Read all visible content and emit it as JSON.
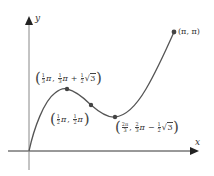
{
  "diagram": {
    "type": "function-graph",
    "axes": {
      "x_label": "x",
      "y_label": "y",
      "origin_px": [
        29,
        151
      ]
    },
    "curve": {
      "description": "y = x + sin(2x), 0 <= x <= pi",
      "color": "#555555"
    },
    "points": [
      {
        "name": "local-max",
        "label": "(1/3 π, 1/3 π + 1/2 √3)",
        "px": [
          67,
          89
        ]
      },
      {
        "name": "inflection",
        "label": "(1/2 π, 1/2 π)",
        "px": [
          91,
          105
        ]
      },
      {
        "name": "local-min",
        "label": "(2π/3, 2/3 π − 1/2 √3)",
        "px": [
          115,
          117
        ]
      },
      {
        "name": "endpoint",
        "label": "(π, π)",
        "px": [
          174,
          32
        ]
      }
    ],
    "labels": {
      "max": {
        "a_num": "1",
        "a_den": "3",
        "pi": "π",
        "b_num": "1",
        "b_den": "3",
        "plus": "+",
        "c_num": "1",
        "c_den": "2",
        "root": "3"
      },
      "inflection": {
        "a_num": "1",
        "a_den": "2",
        "pi": "π",
        "b_num": "1",
        "b_den": "2"
      },
      "min": {
        "a_num": "2π",
        "a_den": "3",
        "b_num": "2",
        "b_den": "3",
        "pi": "π",
        "minus": "−",
        "c_num": "1",
        "c_den": "2",
        "root": "3"
      },
      "end": {
        "text": "(π, π)"
      }
    },
    "colors": {
      "axis": "#333333",
      "curve": "#555555",
      "dot": "#444444",
      "text": "#333333"
    }
  }
}
